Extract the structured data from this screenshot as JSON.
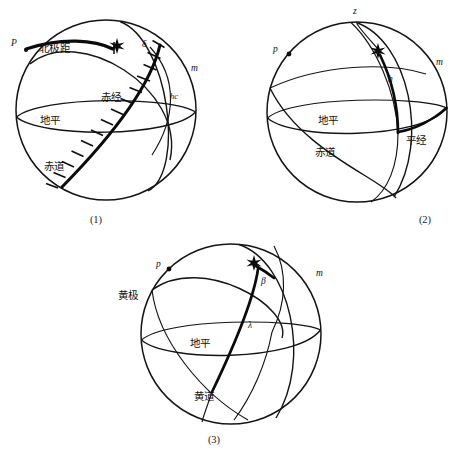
{
  "page": {
    "width": 463,
    "height": 454,
    "background": "#ffffff",
    "ink": "#111111"
  },
  "figures": [
    {
      "id": "fig-1",
      "caption": "(1)",
      "system": "equatorial",
      "labels": {
        "pole": "P",
        "polar_distance": "北极距",
        "declination": "δ",
        "right_ascension": "赤经",
        "horizon": "地平",
        "equator": "赤道",
        "meridian": "m",
        "hour_circle": "hc"
      }
    },
    {
      "id": "fig-2",
      "caption": "(2)",
      "system": "horizontal",
      "labels": {
        "zenith": "z",
        "pole": "p",
        "altitude": "h",
        "horizon": "地平",
        "equator": "赤道",
        "azimuth": "平经",
        "meridian": "m"
      }
    },
    {
      "id": "fig-3",
      "caption": "(3)",
      "system": "ecliptic",
      "labels": {
        "pole": "p",
        "ecliptic_pole": "黄极",
        "latitude": "β",
        "longitude": "λ",
        "horizon": "地平",
        "ecliptic": "黄道",
        "meridian": "m"
      }
    }
  ],
  "footnote": {
    "text": "",
    "visible": false
  }
}
